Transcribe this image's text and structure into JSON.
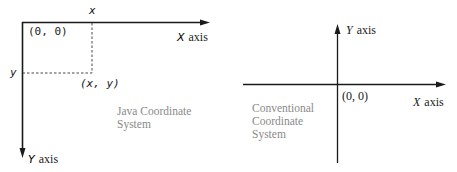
{
  "java_diagram": {
    "origin_label": "(0, 0)",
    "x_tick_label": "x",
    "y_tick_label": "y",
    "point_label": "(x, y)",
    "x_axis_letter": "X",
    "x_axis_word": "axis",
    "y_axis_letter": "Y",
    "y_axis_word": "axis",
    "caption_line1": "Java Coordinate",
    "caption_line2": "System"
  },
  "conventional_diagram": {
    "origin_label": "(0, 0)",
    "x_axis_letter": "X",
    "x_axis_word": "axis",
    "y_axis_letter": "Y",
    "y_axis_word": "axis",
    "caption_line1": "Conventional",
    "caption_line2": "Coordinate",
    "caption_line3": "System"
  },
  "colors": {
    "axis": "#1a1a1a",
    "caption": "#8a8a8a",
    "background": "#ffffff"
  }
}
